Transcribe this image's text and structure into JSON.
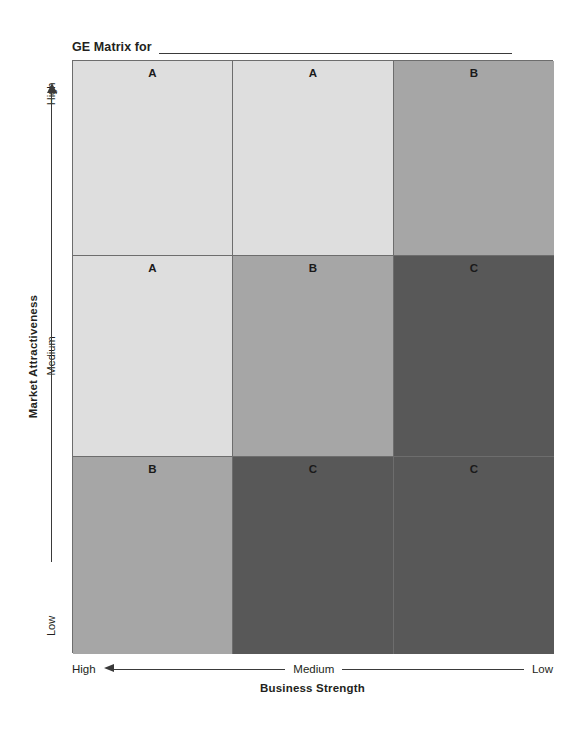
{
  "title": {
    "text": "GE Matrix for",
    "blank_line": true
  },
  "y_axis": {
    "title": "Market Attractiveness",
    "ticks": [
      "High",
      "Medium",
      "Low"
    ],
    "arrow": "up-arrow-icon"
  },
  "x_axis": {
    "title": "Business Strength",
    "ticks": [
      "High",
      "Medium",
      "Low"
    ],
    "arrow": "left-arrow-icon"
  },
  "colors": {
    "grade_a": "#dedede",
    "grade_b": "#a6a6a6",
    "grade_c": "#585858",
    "border": "#6d6d6d",
    "text": "#231f20"
  },
  "chart_data": {
    "type": "heatmap",
    "title": "GE Matrix for",
    "xlabel": "Business Strength",
    "ylabel": "Market Attractiveness",
    "x_categories": [
      "High",
      "Medium",
      "Low"
    ],
    "y_categories": [
      "High",
      "Medium",
      "Low"
    ],
    "legend": [
      {
        "grade": "A",
        "shade": "#dedede",
        "meaning": "invest / grow"
      },
      {
        "grade": "B",
        "shade": "#a6a6a6",
        "meaning": "selective / hold"
      },
      {
        "grade": "C",
        "shade": "#585858",
        "meaning": "harvest / divest"
      }
    ],
    "grid": true,
    "cells": [
      {
        "row": "High",
        "col": "High",
        "grade": "A",
        "shade": "#dedede"
      },
      {
        "row": "High",
        "col": "Medium",
        "grade": "A",
        "shade": "#dedede"
      },
      {
        "row": "High",
        "col": "Low",
        "grade": "B",
        "shade": "#a6a6a6"
      },
      {
        "row": "Medium",
        "col": "High",
        "grade": "A",
        "shade": "#dedede"
      },
      {
        "row": "Medium",
        "col": "Medium",
        "grade": "B",
        "shade": "#a6a6a6"
      },
      {
        "row": "Medium",
        "col": "Low",
        "grade": "C",
        "shade": "#585858"
      },
      {
        "row": "Low",
        "col": "High",
        "grade": "B",
        "shade": "#a6a6a6"
      },
      {
        "row": "Low",
        "col": "Medium",
        "grade": "C",
        "shade": "#585858"
      },
      {
        "row": "Low",
        "col": "Low",
        "grade": "C",
        "shade": "#585858"
      }
    ]
  }
}
